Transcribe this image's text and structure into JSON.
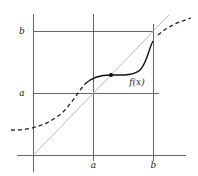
{
  "diagram": {
    "labels": {
      "y_b": "b",
      "y_a": "a",
      "x_a": "a",
      "x_b": "b",
      "function": "f(x)"
    },
    "colors": {
      "axes": "#555555",
      "grid": "#555555",
      "diagonal": "#bbbbbb",
      "curve": "#111111",
      "background": "#ffffff"
    },
    "elements": [
      {
        "type": "axis",
        "name": "x-axis"
      },
      {
        "type": "axis",
        "name": "y-axis"
      },
      {
        "type": "line",
        "name": "diagonal y = x"
      },
      {
        "type": "curve",
        "name": "f(x) solid on [a, b]"
      },
      {
        "type": "curve",
        "name": "f(x) dashed outside [a, b]"
      },
      {
        "type": "point",
        "name": "fixed point"
      }
    ]
  }
}
